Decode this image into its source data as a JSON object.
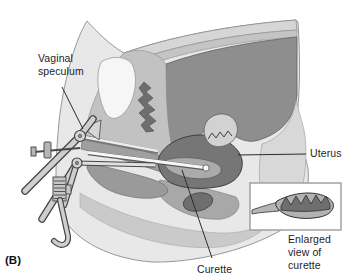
{
  "figure": {
    "panel_label": "(B)",
    "labels": {
      "vaginal_speculum": "Vaginal\nspeculum",
      "uterus": "Uterus",
      "curette": "Curette",
      "inset_caption": "Enlarged\nview of curette"
    },
    "colors": {
      "background": "#ffffff",
      "body_fill": "#e8e8e8",
      "abdominal_wall": "#d6d6d6",
      "cavity_fill": "#8e8e8e",
      "uterus_fill": "#767676",
      "uterus_cavity_fill": "#ababab",
      "bladder_fill": "#f6f6f6",
      "instrument_light": "#d2d2d2",
      "dark_gray": "#6e6e6e",
      "curette_head_fill": "#b2b2b2",
      "inset_background": "#ffffff",
      "outline": "#3e3e3e",
      "label_text": "#1d1d1d"
    }
  }
}
